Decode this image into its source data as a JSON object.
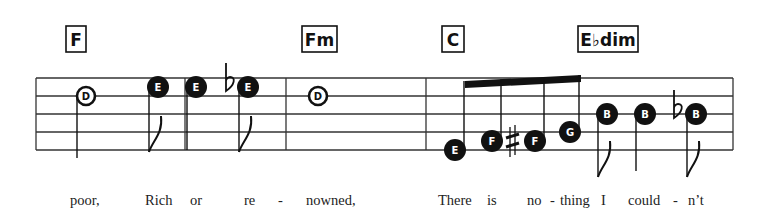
{
  "staff": {
    "left": 36,
    "right": 733,
    "top": 78,
    "spacing": 18,
    "lines": 5,
    "barlines": [
      185,
      286,
      426,
      733
    ]
  },
  "chords": [
    {
      "label": "F",
      "x": 66,
      "w": 20
    },
    {
      "label": "Fm",
      "x": 302,
      "w": 35
    },
    {
      "label": "C",
      "x": 442,
      "w": 22
    },
    {
      "label": "E♭dim",
      "x": 578,
      "w": 60
    }
  ],
  "notes": [
    {
      "letter": "D",
      "x": 86,
      "y": 96,
      "style": "open",
      "stem": "down",
      "stemEnd": 158,
      "flag": false
    },
    {
      "letter": "E",
      "x": 158,
      "y": 87,
      "style": "filled",
      "stem": "down",
      "stemEnd": 152,
      "flag": true
    },
    {
      "letter": "E",
      "x": 196,
      "y": 87,
      "style": "filled",
      "stem": "down",
      "stemEnd": 150,
      "flag": false
    },
    {
      "letter": "E",
      "x": 248,
      "y": 87,
      "style": "filled",
      "stem": "down",
      "stemEnd": 152,
      "flag": true,
      "accidental": "flat"
    },
    {
      "letter": "D",
      "x": 318,
      "y": 96,
      "style": "open",
      "stem": "none"
    },
    {
      "letter": "E",
      "x": 455,
      "y": 150,
      "style": "filled",
      "stem": "up",
      "beam": true
    },
    {
      "letter": "F",
      "x": 492,
      "y": 141,
      "style": "filled",
      "stem": "up",
      "beam": true
    },
    {
      "letter": "F",
      "x": 535,
      "y": 141,
      "style": "filled",
      "stem": "up",
      "beam": true,
      "accidental": "sharp"
    },
    {
      "letter": "G",
      "x": 570,
      "y": 132,
      "style": "filled",
      "stem": "up",
      "beam": true
    },
    {
      "letter": "B",
      "x": 607,
      "y": 114,
      "style": "filled",
      "stem": "down",
      "stemEnd": 177,
      "flag": true
    },
    {
      "letter": "B",
      "x": 645,
      "y": 114,
      "style": "filled",
      "stem": "down",
      "stemEnd": 171,
      "flag": false
    },
    {
      "letter": "B",
      "x": 696,
      "y": 114,
      "style": "filled",
      "stem": "down",
      "stemEnd": 177,
      "flag": true,
      "accidental": "flat"
    }
  ],
  "beam": {
    "x1": 465,
    "y1": 81,
    "x2": 581,
    "y2": 75
  },
  "lyrics": [
    {
      "text": "poor,",
      "x": 70
    },
    {
      "text": "Rich",
      "x": 145
    },
    {
      "text": "or",
      "x": 190
    },
    {
      "text": "re",
      "x": 244
    },
    {
      "text": "-",
      "x": 278
    },
    {
      "text": "nowned,",
      "x": 306
    },
    {
      "text": "There",
      "x": 438
    },
    {
      "text": "is",
      "x": 487
    },
    {
      "text": "no",
      "x": 527
    },
    {
      "text": "-",
      "x": 550
    },
    {
      "text": "thing",
      "x": 560
    },
    {
      "text": "I",
      "x": 601
    },
    {
      "text": "could",
      "x": 628
    },
    {
      "text": "-",
      "x": 673
    },
    {
      "text": "n’t",
      "x": 688
    }
  ],
  "lyricsY": 205,
  "colors": {
    "ink": "#111111",
    "staff": "#333333"
  }
}
